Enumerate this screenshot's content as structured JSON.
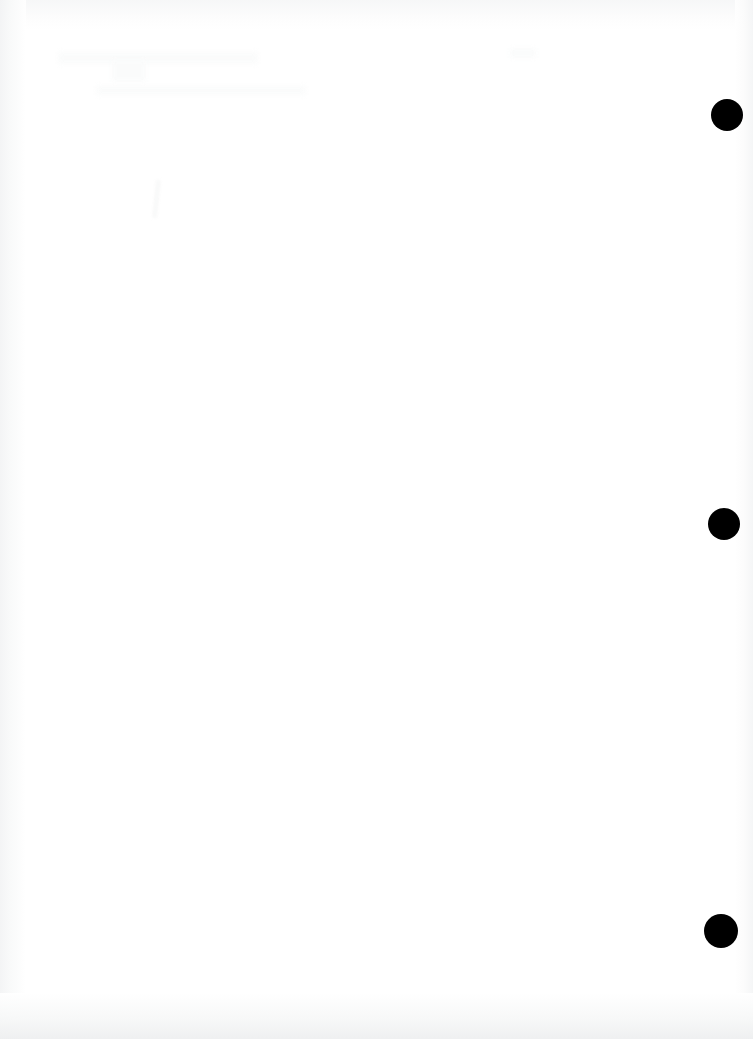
{
  "page": {
    "kind": "scanned-document-page",
    "content_text": "",
    "background_color": "#ffffff",
    "width_px": 753,
    "height_px": 1039
  },
  "marks": {
    "label": "registration-marks",
    "color": "#000000",
    "count": 3,
    "items": [
      {
        "name": "registration-mark-top",
        "left_px": 711,
        "top_px": 99,
        "diameter_px": 32
      },
      {
        "name": "registration-mark-middle",
        "left_px": 708,
        "top_px": 508,
        "diameter_px": 32
      },
      {
        "name": "registration-mark-bottom",
        "left_px": 704,
        "top_px": 914,
        "diameter_px": 34
      }
    ]
  },
  "artifacts": {
    "label": "scan-artifacts",
    "tint_color": "#f4f5f6",
    "ghost_color": "#fafbfb",
    "edges": [
      "left",
      "right",
      "top",
      "bottom"
    ]
  }
}
